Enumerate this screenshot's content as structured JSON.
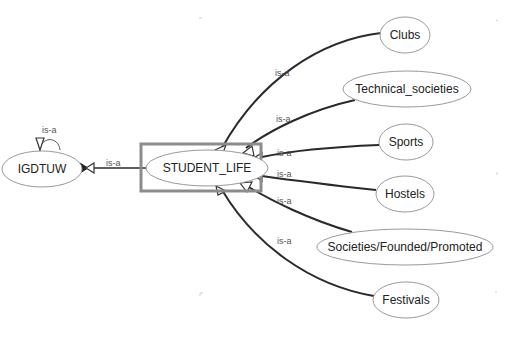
{
  "diagram": {
    "type": "ontology-graph",
    "relation_label": "is-a",
    "selected_node": "STUDENT_LIFE",
    "nodes": [
      {
        "id": "igdtuw",
        "label": "IGDTUW",
        "cx": 42,
        "cy": 169,
        "rx": 40,
        "ry": 18
      },
      {
        "id": "student_life",
        "label": "STUDENT_LIFE",
        "cx": 207,
        "cy": 168,
        "rx": 61,
        "ry": 18
      },
      {
        "id": "clubs",
        "label": "Clubs",
        "cx": 405,
        "cy": 35,
        "rx": 25,
        "ry": 18
      },
      {
        "id": "technical_societies",
        "label": "Technical_societies",
        "cx": 407,
        "cy": 89,
        "rx": 64,
        "ry": 18
      },
      {
        "id": "sports",
        "label": "Sports",
        "cx": 406,
        "cy": 142,
        "rx": 27,
        "ry": 18
      },
      {
        "id": "hostels",
        "label": "Hostels",
        "cx": 405,
        "cy": 194,
        "rx": 29,
        "ry": 18
      },
      {
        "id": "societies_founded_promoted",
        "label": "Societies/Founded/Promoted",
        "cx": 405,
        "cy": 247,
        "rx": 88,
        "ry": 18
      },
      {
        "id": "festivals",
        "label": "Festivals",
        "cx": 406,
        "cy": 300,
        "rx": 33,
        "ry": 18
      }
    ],
    "edges": [
      {
        "from": "IGDTUW",
        "to": "IGDTUW",
        "label": "is-a",
        "kind": "self-loop"
      },
      {
        "from": "STUDENT_LIFE",
        "to": "IGDTUW",
        "label": "is-a"
      },
      {
        "from": "Clubs",
        "to": "STUDENT_LIFE",
        "label": "is-a"
      },
      {
        "from": "Technical_societies",
        "to": "STUDENT_LIFE",
        "label": "is-a"
      },
      {
        "from": "Sports",
        "to": "STUDENT_LIFE",
        "label": "is-a"
      },
      {
        "from": "Hostels",
        "to": "STUDENT_LIFE",
        "label": "is-a"
      },
      {
        "from": "Societies/Founded/Promoted",
        "to": "STUDENT_LIFE",
        "label": "is-a"
      },
      {
        "from": "Festivals",
        "to": "STUDENT_LIFE",
        "label": "is-a"
      }
    ]
  }
}
